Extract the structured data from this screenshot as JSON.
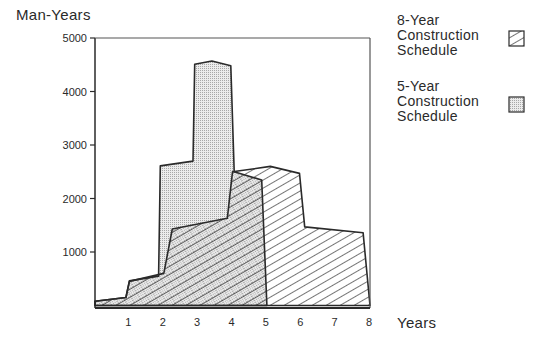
{
  "chart_data": {
    "type": "area",
    "title": "",
    "ylabel": "Man-Years",
    "xlabel": "Years",
    "xlim": [
      0,
      8
    ],
    "ylim": [
      0,
      5000
    ],
    "x_ticks": [
      1,
      2,
      3,
      4,
      5,
      6,
      7,
      8
    ],
    "y_ticks": [
      1000,
      2000,
      3000,
      4000,
      5000
    ],
    "grid": false,
    "legend_position": "right",
    "series": [
      {
        "name": "8-Year Construction Schedule",
        "fill": "hatch",
        "points": [
          [
            0.0,
            0
          ],
          [
            0.0,
            80
          ],
          [
            0.9,
            150
          ],
          [
            1.0,
            450
          ],
          [
            2.0,
            600
          ],
          [
            2.25,
            1430
          ],
          [
            3.85,
            1630
          ],
          [
            4.0,
            2500
          ],
          [
            5.1,
            2600
          ],
          [
            5.95,
            2470
          ],
          [
            6.1,
            1470
          ],
          [
            7.8,
            1360
          ],
          [
            8.0,
            0
          ]
        ]
      },
      {
        "name": "5-Year Construction Schedule",
        "fill": "dotted",
        "points": [
          [
            0.0,
            0
          ],
          [
            0.0,
            80
          ],
          [
            0.9,
            150
          ],
          [
            1.0,
            460
          ],
          [
            1.85,
            550
          ],
          [
            1.9,
            2610
          ],
          [
            2.85,
            2700
          ],
          [
            2.9,
            4510
          ],
          [
            3.4,
            4570
          ],
          [
            3.95,
            4480
          ],
          [
            4.05,
            2500
          ],
          [
            4.85,
            2345
          ],
          [
            5.0,
            0
          ]
        ]
      }
    ]
  },
  "labels": {
    "y_title": "Man-Years",
    "x_title": "Years",
    "x_ticks": [
      "1",
      "2",
      "3",
      "4",
      "5",
      "6",
      "7",
      "8"
    ],
    "y_ticks": [
      "1000",
      "2000",
      "3000",
      "4000",
      "5000"
    ]
  },
  "legend": [
    {
      "lines": [
        "8-Year",
        "Construction",
        "Schedule"
      ],
      "pattern": "hatch"
    },
    {
      "lines": [
        "5-Year",
        "Construction",
        "Schedule"
      ],
      "pattern": "dotted"
    }
  ],
  "colors": {
    "ink": "#2a2a2a",
    "dot_fill": "#d8d8d8",
    "background": "#ffffff"
  }
}
